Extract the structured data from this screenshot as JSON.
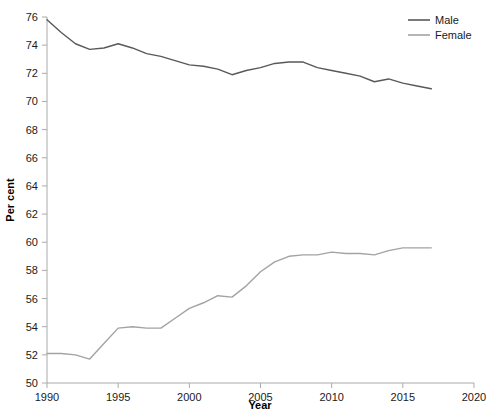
{
  "chart_data": {
    "type": "line",
    "title": "",
    "xlabel": "Year",
    "ylabel": "Per cent",
    "xlim": [
      1990,
      2020
    ],
    "ylim": [
      50,
      76
    ],
    "xticks": [
      1990,
      1995,
      2000,
      2005,
      2010,
      2015,
      2020
    ],
    "yticks": [
      50,
      52,
      54,
      56,
      58,
      60,
      62,
      64,
      66,
      68,
      70,
      72,
      74,
      76
    ],
    "grid": false,
    "legend_position": "top-right",
    "x": [
      1990,
      1991,
      1992,
      1993,
      1994,
      1995,
      1996,
      1997,
      1998,
      1999,
      2000,
      2001,
      2002,
      2003,
      2004,
      2005,
      2006,
      2007,
      2008,
      2009,
      2010,
      2011,
      2012,
      2013,
      2014,
      2015,
      2016,
      2017
    ],
    "series": [
      {
        "name": "Male",
        "color": "#595959",
        "values": [
          75.8,
          74.9,
          74.1,
          73.7,
          73.8,
          74.1,
          73.8,
          73.4,
          73.2,
          72.9,
          72.6,
          72.5,
          72.3,
          71.9,
          72.2,
          72.4,
          72.7,
          72.8,
          72.8,
          72.4,
          72.2,
          72.0,
          71.8,
          71.4,
          71.6,
          71.3,
          71.1,
          70.9
        ]
      },
      {
        "name": "Female",
        "color": "#a3a3a3",
        "values": [
          52.1,
          52.1,
          52.0,
          51.7,
          52.8,
          53.9,
          54.0,
          53.9,
          53.9,
          54.6,
          55.3,
          55.7,
          56.2,
          56.1,
          56.9,
          57.9,
          58.6,
          59.0,
          59.1,
          59.1,
          59.3,
          59.2,
          59.2,
          59.1,
          59.4,
          59.6,
          59.6,
          59.6
        ]
      }
    ]
  },
  "legend": {
    "items": [
      {
        "label": "Male",
        "color": "#595959"
      },
      {
        "label": "Female",
        "color": "#a3a3a3"
      }
    ]
  },
  "axes": {
    "x_title": "Year",
    "y_title": "Per cent",
    "x_tick_labels": [
      "1990",
      "1995",
      "2000",
      "2005",
      "2010",
      "2015",
      "2020"
    ],
    "y_tick_labels": [
      "50",
      "52",
      "54",
      "56",
      "58",
      "60",
      "62",
      "64",
      "66",
      "68",
      "70",
      "72",
      "74",
      "76"
    ]
  }
}
